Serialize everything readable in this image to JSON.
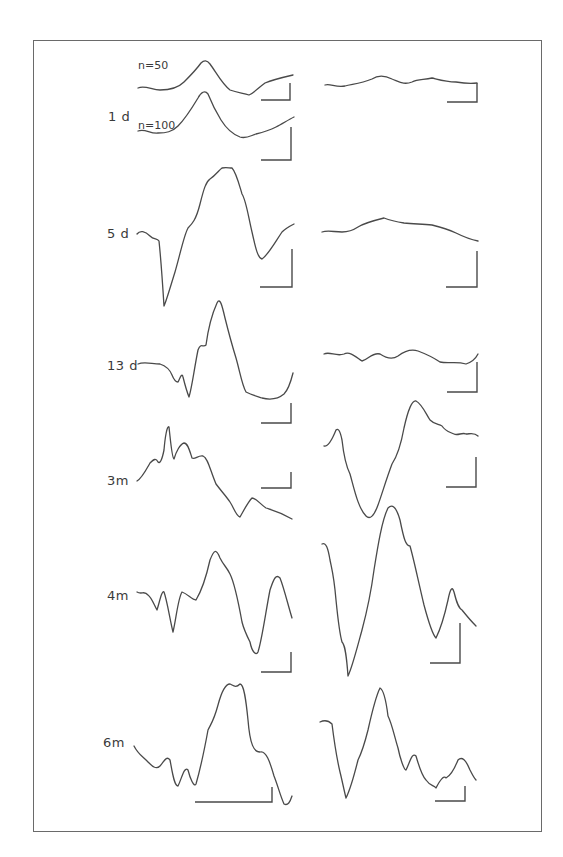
{
  "figure": {
    "type": "evoked-response-waveforms",
    "columns": [
      "left",
      "right"
    ],
    "rows": [
      {
        "label": "1 d",
        "traces": [
          {
            "column": "left",
            "annotation": "n=50"
          },
          {
            "column": "left",
            "annotation": "n=100"
          },
          {
            "column": "right",
            "annotation": ""
          }
        ]
      },
      {
        "label": "5 d",
        "traces": [
          {
            "column": "left"
          },
          {
            "column": "right"
          }
        ]
      },
      {
        "label": "13 d",
        "traces": [
          {
            "column": "left"
          },
          {
            "column": "right"
          }
        ]
      },
      {
        "label": "3m",
        "traces": [
          {
            "column": "left"
          },
          {
            "column": "right"
          }
        ]
      },
      {
        "label": "4m",
        "traces": [
          {
            "column": "left"
          },
          {
            "column": "right"
          }
        ]
      },
      {
        "label": "6m",
        "traces": [
          {
            "column": "left"
          },
          {
            "column": "right"
          }
        ]
      }
    ],
    "annotations": {
      "n50": "n=50",
      "n100": "n=100"
    },
    "colors": {
      "trace": "#4a4a4a",
      "frame": "#6a6a6a",
      "background": "#ffffff"
    }
  }
}
